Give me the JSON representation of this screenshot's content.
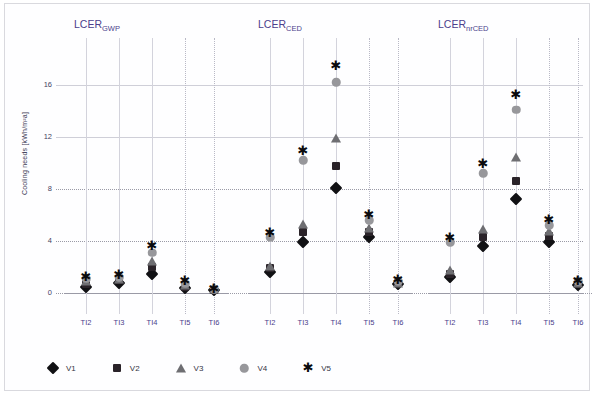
{
  "figure": {
    "y_axis_label": "Cooling needs [kWh/m²a]",
    "y_ticks": [
      "0",
      "4",
      "8",
      "12",
      "16"
    ],
    "x_ticks": [
      "TI2",
      "TI3",
      "TI4",
      "TI5",
      "TI6"
    ],
    "panel_titles": [
      {
        "base": "LCER",
        "sub": "GWP"
      },
      {
        "base": "LCER",
        "sub": "CED"
      },
      {
        "base": "LCER",
        "sub": "nrCED"
      }
    ],
    "legend": [
      {
        "label": "V1",
        "marker": "diamond-marker"
      },
      {
        "label": "V2",
        "marker": "square-marker"
      },
      {
        "label": "V3",
        "marker": "triangle-marker"
      },
      {
        "label": "V4",
        "marker": "circle-marker"
      },
      {
        "label": "V5",
        "marker": "asterisk-marker"
      }
    ],
    "colors": {
      "title": "#4b3f8c",
      "tick": "#46425f",
      "v1": "#111114",
      "v2": "#2a2329",
      "v3": "#6e6e72",
      "v4": "#97979b",
      "v5": "#0b0b0d",
      "grid": "#9a9aa6"
    }
  },
  "chart_data": [
    {
      "type": "scatter",
      "title": "LCER_GWP",
      "xlabel": "",
      "ylabel": "Cooling needs [kWh/m²a]",
      "categories": [
        "TI2",
        "TI3",
        "TI4",
        "TI5",
        "TI6"
      ],
      "ylim": [
        0,
        18
      ],
      "yticks": [
        0,
        4,
        8,
        12,
        16
      ],
      "grid": true,
      "legend_position": "bottom",
      "series": [
        {
          "name": "V1",
          "marker": "diamond",
          "values": [
            0.5,
            0.8,
            1.5,
            0.4,
            0.2
          ]
        },
        {
          "name": "V2",
          "marker": "square",
          "values": [
            0.7,
            1.0,
            2.0,
            0.5,
            0.2
          ]
        },
        {
          "name": "V3",
          "marker": "triangle",
          "values": [
            0.9,
            1.1,
            2.5,
            0.6,
            0.3
          ]
        },
        {
          "name": "V4",
          "marker": "circle",
          "values": [
            1.1,
            1.2,
            3.1,
            0.7,
            0.3
          ]
        },
        {
          "name": "V5",
          "marker": "asterisk",
          "values": [
            1.2,
            1.4,
            3.6,
            0.9,
            0.3
          ]
        }
      ]
    },
    {
      "type": "scatter",
      "title": "LCER_CED",
      "xlabel": "",
      "ylabel": "Cooling needs [kWh/m²a]",
      "categories": [
        "TI2",
        "TI3",
        "TI4",
        "TI5",
        "TI6"
      ],
      "ylim": [
        0,
        18
      ],
      "yticks": [
        0,
        4,
        8,
        12,
        16
      ],
      "grid": true,
      "legend_position": "bottom",
      "series": [
        {
          "name": "V1",
          "marker": "diamond",
          "values": [
            1.6,
            3.9,
            8.1,
            4.3,
            0.7
          ]
        },
        {
          "name": "V2",
          "marker": "square",
          "values": [
            1.9,
            4.7,
            9.8,
            4.7,
            0.8
          ]
        },
        {
          "name": "V3",
          "marker": "triangle",
          "values": [
            2.1,
            5.3,
            11.9,
            5.0,
            0.8
          ]
        },
        {
          "name": "V4",
          "marker": "circle",
          "values": [
            4.3,
            10.2,
            16.2,
            5.6,
            0.9
          ]
        },
        {
          "name": "V5",
          "marker": "asterisk",
          "values": [
            4.6,
            10.9,
            17.5,
            6.0,
            1.0
          ]
        }
      ]
    },
    {
      "type": "scatter",
      "title": "LCER_nrCED",
      "xlabel": "",
      "ylabel": "Cooling needs [kWh/m²a]",
      "categories": [
        "TI2",
        "TI3",
        "TI4",
        "TI5",
        "TI6"
      ],
      "ylim": [
        0,
        18
      ],
      "yticks": [
        0,
        4,
        8,
        12,
        16
      ],
      "grid": true,
      "legend_position": "bottom",
      "series": [
        {
          "name": "V1",
          "marker": "diamond",
          "values": [
            1.2,
            3.6,
            7.2,
            3.9,
            0.6
          ]
        },
        {
          "name": "V2",
          "marker": "square",
          "values": [
            1.5,
            4.3,
            8.6,
            4.4,
            0.7
          ]
        },
        {
          "name": "V3",
          "marker": "triangle",
          "values": [
            1.8,
            4.9,
            10.5,
            4.8,
            0.8
          ]
        },
        {
          "name": "V4",
          "marker": "circle",
          "values": [
            3.9,
            9.2,
            14.1,
            5.2,
            0.9
          ]
        },
        {
          "name": "V5",
          "marker": "asterisk",
          "values": [
            4.2,
            9.9,
            15.2,
            5.6,
            0.9
          ]
        }
      ]
    }
  ]
}
